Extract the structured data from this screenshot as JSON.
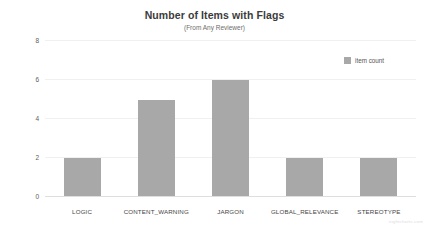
{
  "chart_data": {
    "type": "bar",
    "title": "Number of Items with Flags",
    "subtitle": "(From Any Reviewer)",
    "xlabel": "",
    "ylabel": "number of items",
    "categories": [
      "LOGIC",
      "CONTENT_WARNING",
      "JARGON",
      "GLOBAL_RELEVANCE",
      "STEREOTYPE"
    ],
    "values": [
      2,
      5,
      6,
      2,
      2
    ],
    "series": [
      {
        "name": "item count",
        "values": [
          2,
          5,
          6,
          2,
          2
        ]
      }
    ],
    "ylim": [
      0,
      8
    ],
    "yticks": [
      0,
      2,
      4,
      6,
      8
    ],
    "ytick_labels": [
      "0",
      "2",
      "4",
      "6",
      "8"
    ],
    "grid": true,
    "legend_position": "top-right",
    "bar_color": "#a8a8a8"
  },
  "legend": {
    "entries": [
      {
        "label": "item count",
        "color": "#a8a8a8"
      }
    ]
  },
  "watermark": {
    "text": "nightcharts.com"
  }
}
